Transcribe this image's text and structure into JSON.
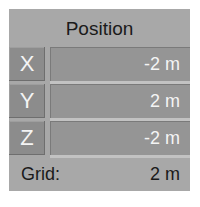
{
  "panel": {
    "title": "Position",
    "axes": [
      {
        "label": "X",
        "value": "-2 m"
      },
      {
        "label": "Y",
        "value": "2 m"
      },
      {
        "label": "Z",
        "value": "-2 m"
      }
    ],
    "grid": {
      "label": "Grid:",
      "value": "2 m"
    }
  },
  "colors": {
    "panel_bg": "#a8a8a8",
    "axis_label_bg": "#8c8c8c",
    "field_bg": "#959595",
    "field_text": "#f4f4f4"
  }
}
